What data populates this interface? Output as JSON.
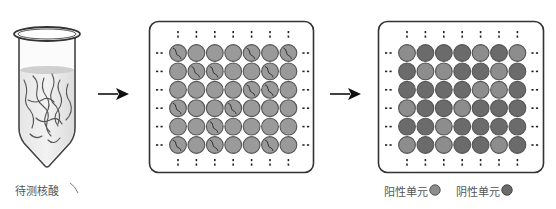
{
  "sample": {
    "label": "待测核酸",
    "icon": "test-tube-icon"
  },
  "arrows": [
    {
      "name": "arrow-1",
      "icon": "right-arrow-icon"
    },
    {
      "name": "arrow-2",
      "icon": "right-arrow-icon"
    }
  ],
  "partition_plate": {
    "rows": 6,
    "cols": 7,
    "well_color": "#9a9a9a",
    "nucleic_acid_wells": [
      [
        0,
        0
      ],
      [
        0,
        4
      ],
      [
        0,
        6
      ],
      [
        1,
        1
      ],
      [
        1,
        2
      ],
      [
        1,
        5
      ],
      [
        2,
        4
      ],
      [
        2,
        5
      ],
      [
        3,
        0
      ],
      [
        3,
        3
      ],
      [
        4,
        2
      ],
      [
        5,
        0
      ],
      [
        5,
        2
      ],
      [
        5,
        5
      ]
    ]
  },
  "result_plate": {
    "rows": 6,
    "cols": 7,
    "pattern": [
      "LDDDLDL",
      "DLLDDLD",
      "DDDDLLD",
      "LDDLDDD",
      "DDLDDDD",
      "LDLDDLD"
    ]
  },
  "legend": {
    "positive_label": "阳性单元",
    "positive_color": "#8d8d8d",
    "negative_label": "阴性单元",
    "negative_color": "#6b6b6b"
  }
}
